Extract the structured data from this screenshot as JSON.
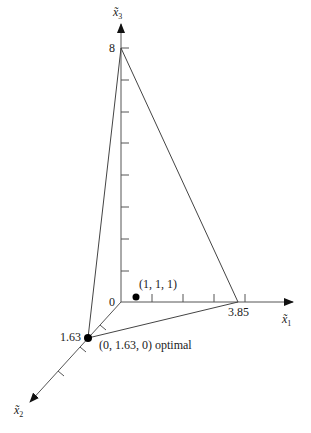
{
  "diagram": {
    "type": "3d-feasible-region",
    "axes": [
      {
        "id": "x1",
        "label": "x̃",
        "subscript": "1",
        "intercept_label": "3.85"
      },
      {
        "id": "x2",
        "label": "x̃",
        "subscript": "2",
        "intercept_label": "1.63"
      },
      {
        "id": "x3",
        "label": "x̃",
        "subscript": "3",
        "intercept_label": "8"
      }
    ],
    "origin_label": "0",
    "points": [
      {
        "id": "interior",
        "label": "(1, 1, 1)"
      },
      {
        "id": "optimal",
        "label": "(0, 1.63, 0) optimal"
      }
    ],
    "plane_vertices": [
      {
        "axis": "x1",
        "value": 3.85
      },
      {
        "axis": "x2",
        "value": 1.63
      },
      {
        "axis": "x3",
        "value": 8
      }
    ],
    "colors": {
      "line": "#555555",
      "point": "#000000",
      "text": "#1a1a1a"
    }
  }
}
